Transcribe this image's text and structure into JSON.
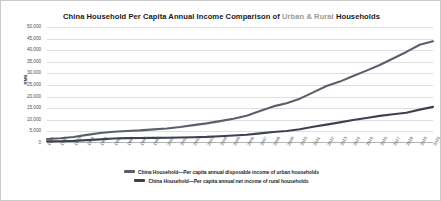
{
  "chart_data": {
    "type": "line",
    "title": "China Household Per Capita Annual Income Comparison of Urban & Rural Households",
    "title_parts": {
      "lead": "China Household Per Capita Annual Income Comparison of",
      "urban": "Urban",
      "amp": "&",
      "rural": "Rural",
      "tail": "Households"
    },
    "xlabel": "",
    "ylabel": "RMB",
    "grid": true,
    "legend_position": "bottom",
    "ylim": [
      0,
      50000
    ],
    "yticks": [
      0,
      5000,
      10000,
      15000,
      20000,
      25000,
      30000,
      35000,
      40000,
      45000,
      50000
    ],
    "ytick_labels": [
      "0",
      "5,000",
      "10,000",
      "15,000",
      "20,000",
      "25,000",
      "30,000",
      "35,000",
      "40,000",
      "45,000",
      "50,000"
    ],
    "categories": [
      "1991",
      "1992",
      "1993",
      "1994",
      "1995",
      "1996",
      "1997",
      "1998",
      "1999",
      "2000",
      "2001",
      "2002",
      "2003",
      "2004",
      "2005",
      "2006",
      "2007",
      "2008",
      "2009",
      "2010",
      "2011",
      "2012",
      "2013",
      "2014",
      "2015",
      "2016",
      "2017",
      "2018",
      "2019",
      "2020"
    ],
    "series": [
      {
        "name": "China Household—Per capita annual disposable income of urban households",
        "color": "#5a5f6b",
        "values": [
          1700,
          2027,
          2577,
          3496,
          4283,
          4839,
          5160,
          5425,
          5854,
          6280,
          6860,
          7703,
          8472,
          9422,
          10493,
          11760,
          13786,
          15781,
          17175,
          19109,
          21810,
          24565,
          26467,
          28844,
          31195,
          33616,
          36396,
          39251,
          42359,
          43834
        ]
      },
      {
        "name": "China Household—Per capita annual net income of rural households",
        "color": "#3c4250",
        "values": [
          709,
          784,
          922,
          1221,
          1578,
          1926,
          2090,
          2162,
          2210,
          2253,
          2366,
          2476,
          2622,
          2936,
          3255,
          3587,
          4140,
          4761,
          5153,
          5919,
          6977,
          7917,
          8896,
          9892,
          10772,
          11696,
          12363,
          13066,
          14389,
          15575
        ]
      }
    ]
  }
}
